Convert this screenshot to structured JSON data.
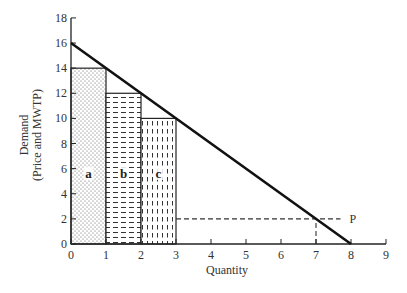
{
  "chart_data": {
    "type": "line",
    "title": "",
    "xlabel": "Quantity",
    "ylabel_line1": "Demand",
    "ylabel_line2": "(Price and MWTP)",
    "xlim": [
      0,
      9
    ],
    "ylim": [
      0,
      18
    ],
    "x_ticks": [
      0,
      1,
      2,
      3,
      4,
      5,
      6,
      7,
      8,
      9
    ],
    "y_ticks": [
      0,
      2,
      4,
      6,
      8,
      10,
      12,
      14,
      16,
      18
    ],
    "grid": false,
    "series": [
      {
        "name": "Demand",
        "kind": "line",
        "x": [
          0,
          8
        ],
        "y": [
          16,
          0
        ]
      }
    ],
    "bars": [
      {
        "label": "a",
        "x_start": 0,
        "x_end": 1,
        "height": 14,
        "pattern": "dots"
      },
      {
        "label": "b",
        "x_start": 1,
        "x_end": 2,
        "height": 12,
        "pattern": "horizontal-dashes"
      },
      {
        "label": "c",
        "x_start": 2,
        "x_end": 3,
        "height": 10,
        "pattern": "vertical-dashes"
      }
    ],
    "reference_lines": [
      {
        "type": "horizontal-dashed",
        "y": 2,
        "x_from": 3,
        "x_to": 7.7,
        "label": "P"
      },
      {
        "type": "vertical-dashed",
        "x": 7,
        "y_from": 0,
        "y_to": 2
      }
    ],
    "annotations": [
      {
        "text": "P",
        "x": 7.9,
        "y": 2
      }
    ]
  }
}
